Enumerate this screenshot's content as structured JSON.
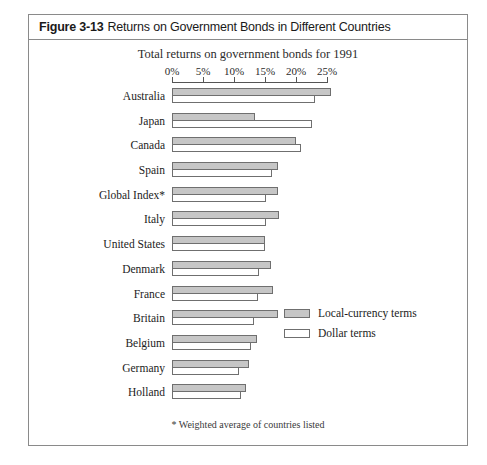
{
  "figure": {
    "number": "Figure 3-13",
    "title": "Returns on Government Bonds in Different Countries",
    "subtitle": "Total returns on government bonds for 1991",
    "footnote": "* Weighted average of countries listed"
  },
  "legend": {
    "local_label": "Local-currency terms",
    "dollar_label": "Dollar terms"
  },
  "colors": {
    "local_fill": "#c6c6c6",
    "dollar_fill": "#ffffff",
    "bar_border": "#6f6f6f",
    "frame_border": "#8a8a8a",
    "text": "#1c1c1c"
  },
  "chart_data": {
    "type": "bar",
    "orientation": "horizontal",
    "title": "Returns on Government Bonds in Different Countries",
    "subtitle": "Total returns on government bonds for 1991",
    "xlabel": "",
    "ylabel": "",
    "xlim": [
      0,
      26
    ],
    "grid": false,
    "legend_position": "inside-bottom-right",
    "tick_labels": [
      "0%",
      "5%",
      "10%",
      "15%",
      "20%",
      "25%"
    ],
    "tick_values": [
      0,
      5,
      10,
      15,
      20,
      25
    ],
    "categories": [
      "Australia",
      "Japan",
      "Canada",
      "Spain",
      "Global Index*",
      "Italy",
      "United States",
      "Denmark",
      "France",
      "Britain",
      "Belgium",
      "Germany",
      "Holland"
    ],
    "series": [
      {
        "name": "Local-currency terms",
        "values": [
          25.6,
          13.4,
          20.0,
          17.1,
          17.1,
          17.2,
          15.0,
          16.0,
          16.3,
          17.1,
          13.7,
          12.4,
          11.9
        ]
      },
      {
        "name": "Dollar terms",
        "values": [
          23.0,
          22.6,
          20.8,
          16.1,
          15.2,
          15.2,
          15.0,
          14.0,
          13.9,
          13.2,
          12.7,
          10.8,
          11.1
        ]
      }
    ],
    "annotations": [
      "* Weighted average of countries listed"
    ]
  }
}
